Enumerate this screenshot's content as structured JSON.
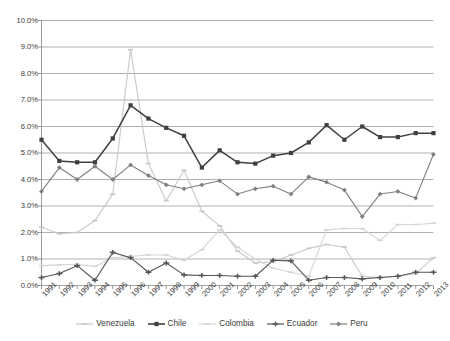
{
  "chart_data": {
    "type": "line",
    "title": "",
    "subtitle": "",
    "xlabel": "",
    "ylabel": "",
    "grid": true,
    "legend_position": "bottom",
    "ylim": [
      0,
      10
    ],
    "ytick_labels": [
      "10.0%",
      "9.0%",
      "8.0%",
      "7.0%",
      "6.0%",
      "5.0%",
      "4.0%",
      "3.0%",
      "2.0%",
      "1.0%",
      "0.0%"
    ],
    "ytick_values": [
      10,
      9,
      8,
      7,
      6,
      5,
      4,
      3,
      2,
      1,
      0
    ],
    "categories": [
      "1991",
      "1992",
      "1993",
      "1994",
      "1995",
      "1996",
      "1997",
      "1998",
      "1999",
      "2000",
      "2001",
      "2002",
      "2003",
      "2004",
      "2005",
      "2006",
      "2007",
      "2008",
      "2009",
      "2010",
      "2011",
      "2012",
      "2013"
    ],
    "series": [
      {
        "name": "Venezuela",
        "color": "#c8c8c8",
        "marker": "dash",
        "values": [
          2.2,
          1.95,
          2.0,
          2.45,
          3.45,
          8.9,
          4.6,
          3.2,
          4.35,
          2.8,
          2.25,
          1.3,
          0.85,
          0.9,
          1.15,
          1.4,
          1.55,
          1.45,
          0.35,
          0.3,
          0.35,
          0.45,
          1.05
        ]
      },
      {
        "name": "Chile",
        "color": "#404040",
        "marker": "square",
        "values": [
          5.5,
          4.7,
          4.65,
          4.65,
          5.55,
          6.8,
          6.3,
          5.95,
          5.65,
          4.45,
          5.1,
          4.65,
          4.6,
          4.9,
          5.0,
          5.4,
          6.05,
          5.5,
          6.0,
          5.6,
          5.6,
          5.75,
          5.75
        ]
      },
      {
        "name": "Colombia",
        "color": "#d5d5d5",
        "marker": "dash",
        "values": [
          0.75,
          0.78,
          0.8,
          0.72,
          1.05,
          1.1,
          1.15,
          1.15,
          0.95,
          1.35,
          2.1,
          1.45,
          1.0,
          0.65,
          0.5,
          0.35,
          2.1,
          2.15,
          2.15,
          1.7,
          2.3,
          2.3,
          2.35
        ]
      },
      {
        "name": "Ecuador",
        "color": "#555555",
        "marker": "dash-cross",
        "values": [
          0.3,
          0.45,
          0.75,
          0.2,
          1.25,
          1.05,
          0.5,
          0.85,
          0.4,
          0.38,
          0.38,
          0.35,
          0.35,
          0.95,
          0.93,
          0.2,
          0.3,
          0.3,
          0.25,
          0.3,
          0.35,
          0.5,
          0.5
        ]
      },
      {
        "name": "Peru",
        "color": "#808080",
        "marker": "diamond",
        "values": [
          3.55,
          4.45,
          4.0,
          4.5,
          4.0,
          4.55,
          4.15,
          3.8,
          3.65,
          3.8,
          3.95,
          3.45,
          3.65,
          3.75,
          3.45,
          4.1,
          3.9,
          3.6,
          2.6,
          3.45,
          3.55,
          3.3,
          4.95
        ]
      }
    ]
  },
  "legend": {
    "items": [
      {
        "label": "Venezuela"
      },
      {
        "label": "Chile"
      },
      {
        "label": "Colombia"
      },
      {
        "label": "Ecuador"
      },
      {
        "label": "Peru"
      }
    ]
  }
}
